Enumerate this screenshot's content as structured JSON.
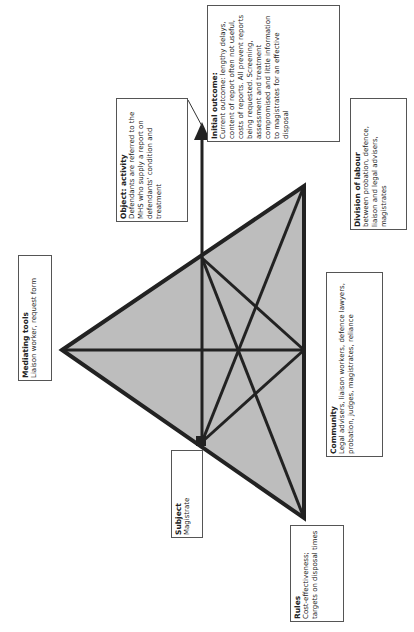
{
  "nodes": {
    "mediating_tools": {
      "title": "Mediating tools",
      "text": "Liaison worker, request form"
    },
    "object": {
      "title": "Object: activity",
      "text": "Defendants are referred to the MHS who supply a report on defendants' condition and treatment"
    },
    "outcome": {
      "title": "Initial outcome:",
      "text": "Current outcome: lengthy delays, content of report often not useful, costs of reports. All prevent reports being requested. Screening, assessment and treatment compromised and little information to magistrates for an effective disposal"
    },
    "subject": {
      "title": "Subject",
      "text": "Magistrate"
    },
    "rules": {
      "title": "Rules",
      "text": "Cost-effectiveness; targets on disposal times"
    },
    "community": {
      "title": "Community",
      "text": "Legal advisers, liaison workers, defence lawyers, probation, judges, magistrates, reliance"
    },
    "division_of_labour": {
      "title": "Division of labour",
      "text": "between probation, defence, liaison and legal advisers, magistrates"
    }
  }
}
